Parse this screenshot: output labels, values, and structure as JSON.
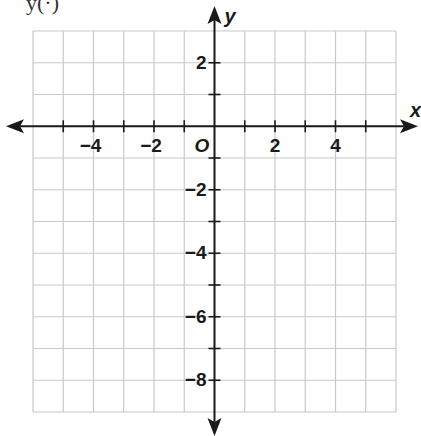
{
  "header_fragment": "y(·)",
  "chart_data": {
    "type": "coordinate-grid",
    "title": "",
    "xlabel": "x",
    "ylabel": "y",
    "origin_label": "O",
    "xlim": [
      -6,
      6
    ],
    "ylim": [
      -9,
      3
    ],
    "grid": true,
    "x_tick_labels": [
      {
        "value": -4,
        "text": "−4"
      },
      {
        "value": -2,
        "text": "−2"
      },
      {
        "value": 2,
        "text": "2"
      },
      {
        "value": 4,
        "text": "4"
      }
    ],
    "y_tick_labels": [
      {
        "value": 2,
        "text": "2"
      },
      {
        "value": -2,
        "text": "−2"
      },
      {
        "value": -4,
        "text": "−4"
      },
      {
        "value": -6,
        "text": "−6"
      },
      {
        "value": -8,
        "text": "−8"
      }
    ],
    "series": []
  },
  "colors": {
    "grid": "#c8c8c8",
    "axis": "#1a1a1a"
  }
}
